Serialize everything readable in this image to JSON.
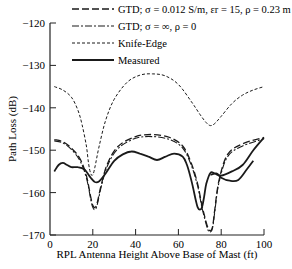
{
  "chart_data": {
    "type": "line",
    "title": "",
    "xlabel": "RPL Antenna Height Above Base of Mast (ft)",
    "ylabel": "Path Loss (dB)",
    "xlim": [
      0,
      100
    ],
    "ylim": [
      -170,
      -120
    ],
    "xticks": [
      0,
      20,
      40,
      60,
      80,
      100
    ],
    "yticks": [
      -120,
      -130,
      -140,
      -150,
      -160,
      -170
    ],
    "xtick_labels": [
      "0",
      "20",
      "40",
      "60",
      "80",
      "100"
    ],
    "ytick_labels": [
      "−120",
      "−130",
      "−140",
      "−150",
      "−160",
      "−170"
    ],
    "grid": false,
    "legend_position": "top",
    "series": [
      {
        "name": "GTD; σ = 0.012 S/m, εr = 15, ρ = 0.23 m",
        "style": "long-dash",
        "x": [
          2,
          6,
          10,
          14,
          17,
          19,
          20,
          21,
          22,
          24,
          27,
          32,
          40,
          48,
          56,
          62,
          66,
          69,
          71,
          73,
          74,
          75,
          76,
          77,
          79,
          83,
          90,
          100
        ],
        "y": [
          -147.5,
          -148,
          -149.5,
          -152,
          -156,
          -161,
          -163,
          -163.5,
          -162.5,
          -158,
          -153,
          -149,
          -146.8,
          -146.3,
          -147,
          -149,
          -153,
          -158,
          -163,
          -167,
          -168.5,
          -169,
          -168,
          -164,
          -157,
          -151,
          -148.5,
          -147
        ]
      },
      {
        "name": "GTD; σ = ∞, ρ = 0",
        "style": "dash-dot",
        "x": [
          2,
          6,
          10,
          14,
          17,
          19,
          20,
          21,
          22,
          24,
          27,
          32,
          40,
          48,
          56,
          62,
          66,
          69,
          71,
          73,
          74,
          75,
          76,
          77,
          79,
          83,
          90,
          100
        ],
        "y": [
          -147.8,
          -148.3,
          -149.8,
          -152.5,
          -156.5,
          -161.5,
          -163.5,
          -164,
          -163,
          -158.5,
          -153.5,
          -149.5,
          -147.2,
          -146.8,
          -147.5,
          -149.5,
          -153.5,
          -158.5,
          -163.5,
          -167.5,
          -169,
          -169.3,
          -168.3,
          -164.5,
          -157.5,
          -151.5,
          -149,
          -147.3
        ]
      },
      {
        "name": "Knife-Edge",
        "style": "short-dash",
        "x": [
          2,
          6,
          10,
          13,
          15,
          17,
          18,
          19,
          20,
          21,
          23,
          26,
          30,
          36,
          42,
          48,
          54,
          60,
          66,
          70,
          73,
          75,
          77,
          80,
          85,
          90,
          95,
          100
        ],
        "y": [
          -135,
          -135.8,
          -137.5,
          -140.5,
          -144,
          -149,
          -153,
          -155.5,
          -155.8,
          -154,
          -149,
          -143,
          -138,
          -134,
          -132.3,
          -132,
          -132.5,
          -134.5,
          -138.5,
          -141.5,
          -143.5,
          -144.2,
          -143.7,
          -142,
          -139,
          -137,
          -135.8,
          -135
        ]
      },
      {
        "name": "Measured",
        "style": "solid",
        "x": [
          2,
          4,
          6,
          8,
          10,
          13,
          16,
          19,
          21,
          23,
          26,
          30,
          34,
          38,
          42,
          46,
          50,
          54,
          58,
          62,
          64,
          66,
          68,
          69,
          70,
          71,
          72,
          73,
          75,
          77,
          80,
          85,
          90,
          95,
          100
        ],
        "y": [
          -155,
          -153.5,
          -153,
          -153.5,
          -154,
          -154,
          -154.5,
          -156.5,
          -157.5,
          -157.3,
          -155.5,
          -152.5,
          -151,
          -150.3,
          -150.8,
          -151.5,
          -152.3,
          -151.5,
          -150.8,
          -151.5,
          -153.5,
          -157,
          -161.5,
          -163.5,
          -164,
          -163.5,
          -161,
          -158,
          -155.3,
          -155.5,
          -156,
          -155,
          -153.5,
          -150,
          -147
        ]
      },
      {
        "name": "Measured (second branch)",
        "style": "solid",
        "x": [
          75,
          78,
          80,
          84,
          88,
          92,
          95
        ],
        "y": [
          -155.8,
          -155.5,
          -156.5,
          -157.2,
          -157,
          -154.5,
          -152.5
        ]
      }
    ]
  },
  "axes": {
    "xlabel": "RPL Antenna Height Above Base of Mast (ft)",
    "ylabel": "Path Loss (dB)"
  }
}
